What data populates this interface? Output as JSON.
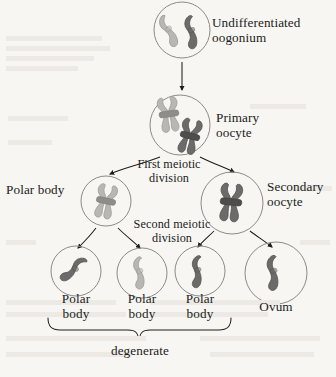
{
  "diagram": {
    "title_text": "Oogenesis",
    "background_color": "#f8f6f3",
    "ink_color": "#201c1a",
    "chromosome_light": "#b9b7b4",
    "chromosome_dark": "#6d6b6a",
    "cell_outline": "#8d8b89"
  },
  "cells": [
    {
      "id": "oogonium",
      "label": "Undifferentiated\noogonium",
      "label_side": "right",
      "chromosomes": "two single chromosomes, one light and one dark"
    },
    {
      "id": "primary-oocyte",
      "label": "Primary\noocyte",
      "label_side": "right",
      "chromosomes": "two duplicated chromosomes, one light and one dark"
    },
    {
      "id": "polar-body-first",
      "label": "Polar body",
      "label_side": "left",
      "chromosomes": "one duplicated light chromosome"
    },
    {
      "id": "secondary-oocyte",
      "label": "Secondary\noocyte",
      "label_side": "right",
      "chromosomes": "one duplicated dark chromosome"
    },
    {
      "id": "polar-body-a",
      "label": "Polar\nbody",
      "label_side": "below",
      "chromosomes": "one dark chromosome"
    },
    {
      "id": "polar-body-b",
      "label": "Polar\nbody",
      "label_side": "below",
      "chromosomes": "one light chromosome"
    },
    {
      "id": "polar-body-c",
      "label": "Polar\nbody",
      "label_side": "below",
      "chromosomes": "one dark chromosome"
    },
    {
      "id": "ovum",
      "label": "Ovum",
      "label_side": "below",
      "chromosomes": "one dark chromosome"
    }
  ],
  "process_labels": {
    "first_division": "First meiotic\ndivision",
    "second_division": "Second meiotic\ndivision",
    "degenerate": "degenerate"
  }
}
